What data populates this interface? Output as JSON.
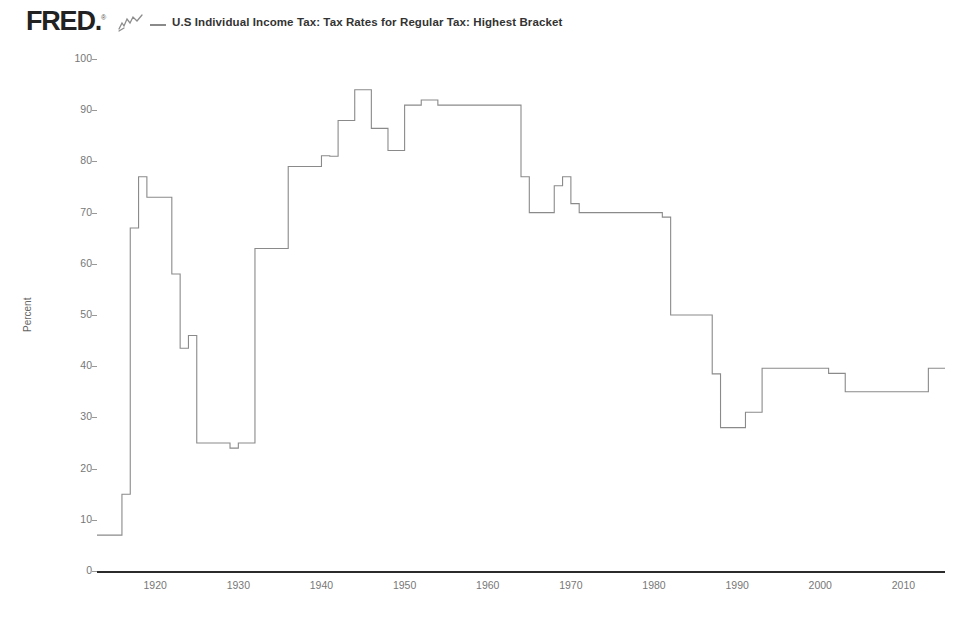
{
  "header": {
    "logo_text": "FRED",
    "logo_registered": "®",
    "squiggle_icon": "line-chart-squiggle-icon",
    "legend_label": "U.S Individual Income Tax: Tax Rates for Regular Tax: Highest Bracket",
    "legend_line_color": "#8a8a8a"
  },
  "footer": {
    "note": "Source: U.S. Department of the Treasury. Internal Revenue Service  fred.stlouisfed.org"
  },
  "chart_data": {
    "type": "line",
    "title": "U.S Individual Income Tax: Tax Rates for Regular Tax: Highest Bracket",
    "xlabel": "",
    "ylabel": "Percent",
    "xlim": [
      1913,
      2015
    ],
    "ylim": [
      0,
      100
    ],
    "grid": false,
    "legend_position": "top",
    "line_color": "#8a8a8a",
    "line_width": 1,
    "step": "post",
    "y_ticks": [
      0,
      10,
      20,
      30,
      40,
      50,
      60,
      70,
      80,
      90,
      100
    ],
    "y_tick_labels": [
      "0",
      "10",
      "20",
      "30",
      "40",
      "50",
      "60",
      "70",
      "80",
      "90",
      "100"
    ],
    "x_ticks": [
      1920,
      1930,
      1940,
      1950,
      1960,
      1970,
      1980,
      1990,
      2000,
      2010
    ],
    "x_tick_labels": [
      "1920",
      "1930",
      "1940",
      "1950",
      "1960",
      "1970",
      "1980",
      "1990",
      "2000",
      "2010"
    ],
    "series": [
      {
        "name": "U.S Individual Income Tax: Tax Rates for Regular Tax: Highest Bracket",
        "x": [
          1913,
          1914,
          1915,
          1916,
          1917,
          1918,
          1919,
          1920,
          1921,
          1922,
          1923,
          1924,
          1925,
          1926,
          1927,
          1928,
          1929,
          1930,
          1931,
          1932,
          1933,
          1934,
          1935,
          1936,
          1937,
          1938,
          1939,
          1940,
          1941,
          1942,
          1943,
          1944,
          1945,
          1946,
          1947,
          1948,
          1949,
          1950,
          1951,
          1952,
          1953,
          1954,
          1955,
          1956,
          1957,
          1958,
          1959,
          1960,
          1961,
          1962,
          1963,
          1964,
          1965,
          1966,
          1967,
          1968,
          1969,
          1970,
          1971,
          1972,
          1973,
          1974,
          1975,
          1976,
          1977,
          1978,
          1979,
          1980,
          1981,
          1982,
          1983,
          1984,
          1985,
          1986,
          1987,
          1988,
          1989,
          1990,
          1991,
          1992,
          1993,
          1994,
          1995,
          1996,
          1997,
          1998,
          1999,
          2000,
          2001,
          2002,
          2003,
          2004,
          2005,
          2006,
          2007,
          2008,
          2009,
          2010,
          2011,
          2012,
          2013,
          2014,
          2015
        ],
        "values": [
          7,
          7,
          7,
          15,
          67,
          77,
          73,
          73,
          73,
          58,
          43.5,
          46,
          25,
          25,
          25,
          25,
          24,
          25,
          25,
          63,
          63,
          63,
          63,
          79,
          79,
          79,
          79,
          81.1,
          81,
          88,
          88,
          94,
          94,
          86.45,
          86.45,
          82.13,
          82.13,
          91,
          91,
          92,
          92,
          91,
          91,
          91,
          91,
          91,
          91,
          91,
          91,
          91,
          91,
          77,
          70,
          70,
          70,
          75.25,
          77,
          71.75,
          70,
          70,
          70,
          70,
          70,
          70,
          70,
          70,
          70,
          70,
          69.125,
          50,
          50,
          50,
          50,
          50,
          38.5,
          28,
          28,
          28,
          31,
          31,
          39.6,
          39.6,
          39.6,
          39.6,
          39.6,
          39.6,
          39.6,
          39.6,
          38.6,
          38.6,
          35,
          35,
          35,
          35,
          35,
          35,
          35,
          35,
          35,
          35,
          39.6,
          39.6,
          39.6
        ]
      }
    ],
    "annotations": [
      {
        "label": "WWII peak",
        "x": 1944,
        "y": 94
      },
      {
        "label": "1950s plateau",
        "x": 1955,
        "y": 91
      },
      {
        "label": "Reagan cut",
        "x": 1988,
        "y": 28
      }
    ]
  }
}
